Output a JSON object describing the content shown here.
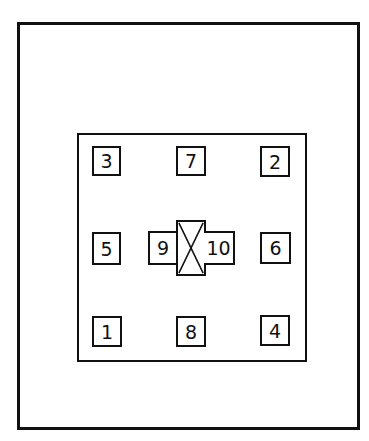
{
  "diagram": {
    "type": "layout-plan",
    "outer_frame": {
      "label": ""
    },
    "inner_frame": {
      "label": ""
    },
    "grid": {
      "top_row": [
        {
          "id": "cell-3",
          "label": "3"
        },
        {
          "id": "cell-7",
          "label": "7"
        },
        {
          "id": "cell-2",
          "label": "2"
        }
      ],
      "middle_row": [
        {
          "id": "cell-5",
          "label": "5"
        },
        {
          "id": "cell-9",
          "label": "9"
        },
        {
          "id": "center-x",
          "label": ""
        },
        {
          "id": "cell-10",
          "label": "10"
        },
        {
          "id": "cell-6",
          "label": "6"
        }
      ],
      "bottom_row": [
        {
          "id": "cell-1",
          "label": "1"
        },
        {
          "id": "cell-8",
          "label": "8"
        },
        {
          "id": "cell-4",
          "label": "4"
        }
      ]
    },
    "center_marker": {
      "symbol": "crossed-box"
    },
    "colors": {
      "stroke": "#111111",
      "background": "#ffffff"
    }
  }
}
